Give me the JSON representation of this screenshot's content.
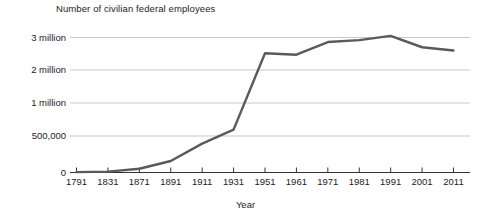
{
  "chart_data": {
    "type": "line",
    "title": "Number of civilian federal employees",
    "xlabel": "Year",
    "ylabel": "",
    "grid": true,
    "legend": "none",
    "line_color": "#5a5a5a",
    "axis_color": "#333333",
    "grid_color": "#c9c9c9",
    "categories": [
      "1791",
      "1831",
      "1871",
      "1891",
      "1911",
      "1931",
      "1951",
      "1961",
      "1971",
      "1981",
      "1991",
      "2001",
      "2011"
    ],
    "x": [
      1791,
      1831,
      1871,
      1891,
      1911,
      1931,
      1951,
      1961,
      1971,
      1981,
      1991,
      2001,
      2011
    ],
    "values": [
      4479,
      11491,
      51020,
      157442,
      395905,
      596745,
      2515000,
      2470000,
      2860000,
      2920000,
      3050000,
      2700000,
      2600000
    ],
    "ytick_labels": [
      "0",
      "500,000",
      "1 million",
      "2 million",
      "3 million"
    ],
    "ytick_values": [
      0,
      500000,
      1000000,
      2000000,
      3000000
    ],
    "ylim": [
      0,
      3200000
    ],
    "xlim": [
      1791,
      2011
    ],
    "annotations": []
  },
  "axes": {
    "x_title": "Year"
  }
}
